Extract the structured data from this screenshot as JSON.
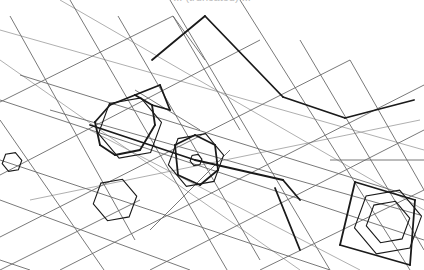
{
  "caption": "... (truncated) ...",
  "colors": {
    "background": "#ffffff",
    "thin": "#6a6a6a",
    "light": "#9a9a9a",
    "heavy": "#1a1a1a"
  },
  "lines": {
    "thin": [
      [
        10,
        16,
        135,
        240
      ],
      [
        70,
        0,
        230,
        275
      ],
      [
        118,
        16,
        260,
        260
      ],
      [
        170,
        0,
        330,
        270
      ],
      [
        240,
        0,
        410,
        270
      ],
      [
        300,
        40,
        424,
        250
      ],
      [
        350,
        60,
        424,
        190
      ],
      [
        0,
        120,
        104,
        270
      ],
      [
        0,
        260,
        30,
        270
      ],
      [
        0,
        102,
        173,
        16
      ],
      [
        0,
        175,
        260,
        40
      ],
      [
        0,
        237,
        350,
        60
      ],
      [
        60,
        270,
        424,
        85
      ],
      [
        150,
        270,
        424,
        130
      ],
      [
        260,
        270,
        424,
        190
      ],
      [
        0,
        270,
        140,
        200
      ],
      [
        0,
        100,
        424,
        240
      ],
      [
        0,
        160,
        330,
        270
      ],
      [
        50,
        110,
        420,
        215
      ],
      [
        0,
        200,
        190,
        270
      ],
      [
        20,
        75,
        424,
        200
      ],
      [
        173,
        16,
        240,
        130
      ],
      [
        173,
        16,
        205,
        60
      ],
      [
        135,
        90,
        200,
        130
      ],
      [
        150,
        230,
        230,
        150
      ],
      [
        330,
        160,
        424,
        160
      ]
    ],
    "light": [
      [
        0,
        30,
        424,
        150
      ],
      [
        0,
        60,
        300,
        270
      ],
      [
        60,
        0,
        424,
        210
      ],
      [
        90,
        130,
        360,
        270
      ],
      [
        30,
        200,
        420,
        120
      ]
    ],
    "heavy": [
      [
        205,
        16,
        283,
        97
      ],
      [
        152,
        60,
        205,
        16
      ],
      [
        283,
        97,
        345,
        118
      ],
      [
        345,
        118,
        414,
        100
      ],
      [
        90,
        125,
        195,
        160
      ],
      [
        195,
        160,
        283,
        180
      ],
      [
        283,
        180,
        300,
        200
      ],
      [
        95,
        122,
        110,
        105
      ],
      [
        110,
        105,
        135,
        95
      ],
      [
        135,
        95,
        152,
        105
      ],
      [
        152,
        105,
        155,
        125
      ],
      [
        155,
        125,
        140,
        150
      ],
      [
        140,
        150,
        115,
        155
      ],
      [
        115,
        155,
        100,
        145
      ],
      [
        100,
        145,
        95,
        122
      ],
      [
        175,
        145,
        195,
        135
      ],
      [
        195,
        135,
        215,
        145
      ],
      [
        215,
        145,
        218,
        170
      ],
      [
        218,
        170,
        200,
        185
      ],
      [
        200,
        185,
        178,
        175
      ],
      [
        178,
        175,
        175,
        145
      ],
      [
        275,
        188,
        300,
        250
      ],
      [
        355,
        182,
        415,
        200
      ],
      [
        355,
        182,
        340,
        245
      ],
      [
        340,
        245,
        410,
        265
      ],
      [
        410,
        265,
        415,
        200
      ],
      [
        135,
        95,
        160,
        85
      ],
      [
        160,
        85,
        170,
        110
      ],
      [
        170,
        110,
        152,
        105
      ]
    ],
    "hexagons": [
      {
        "cx": 130,
        "cy": 128,
        "r": 32
      },
      {
        "cx": 196,
        "cy": 160,
        "r": 28
      },
      {
        "cx": 196,
        "cy": 160,
        "r": 6
      },
      {
        "cx": 388,
        "cy": 222,
        "r": 34
      },
      {
        "cx": 388,
        "cy": 222,
        "r": 22
      },
      {
        "cx": 115,
        "cy": 200,
        "r": 22
      },
      {
        "cx": 12,
        "cy": 162,
        "r": 10
      }
    ]
  }
}
